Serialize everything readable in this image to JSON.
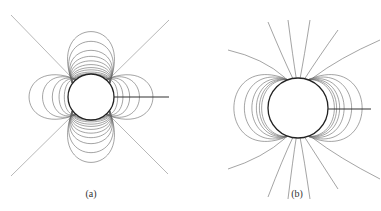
{
  "figures": [
    {
      "label": "(a)",
      "description": "Field lines around a cylinder: quadrupole-like lobe pattern with diagonal asymptotes and a radial cut line to the right",
      "circle": {
        "cx": 91,
        "cy": 97,
        "r": 23
      },
      "cut_line": {
        "x1": 114,
        "y1": 97,
        "x2": 169,
        "y2": 97
      },
      "label_pos": {
        "x": 91,
        "y": 188
      }
    },
    {
      "label": "(b)",
      "description": "Dipole-like field lines around a cylinder with a radial cut line to the right",
      "circle": {
        "cx": 298,
        "cy": 108,
        "r": 30
      },
      "cut_line": {
        "x1": 328,
        "y1": 109,
        "x2": 371,
        "y2": 109
      },
      "label_pos": {
        "x": 297,
        "y": 188
      }
    }
  ],
  "colors": {
    "lines": "#555555",
    "circle": "#222222",
    "background": "#ffffff"
  }
}
